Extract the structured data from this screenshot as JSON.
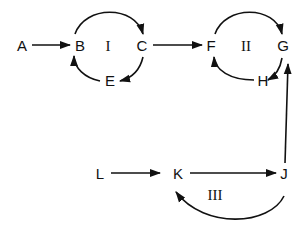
{
  "diagram": {
    "type": "directed-graph",
    "nodes": [
      {
        "id": "A",
        "label": "A",
        "x": 22,
        "y": 51
      },
      {
        "id": "B",
        "label": "B",
        "x": 80,
        "y": 51
      },
      {
        "id": "C",
        "label": "C",
        "x": 142,
        "y": 51
      },
      {
        "id": "E",
        "label": "E",
        "x": 110,
        "y": 86
      },
      {
        "id": "F",
        "label": "F",
        "x": 211,
        "y": 51
      },
      {
        "id": "G",
        "label": "G",
        "x": 283,
        "y": 51
      },
      {
        "id": "H",
        "label": "H",
        "x": 263,
        "y": 86
      },
      {
        "id": "L",
        "label": "L",
        "x": 100,
        "y": 179
      },
      {
        "id": "K",
        "label": "K",
        "x": 178,
        "y": 179
      },
      {
        "id": "J",
        "label": "J",
        "x": 284,
        "y": 179
      }
    ],
    "cycles": [
      {
        "id": "I",
        "label": "I",
        "members": [
          "B",
          "C",
          "E"
        ]
      },
      {
        "id": "II",
        "label": "II",
        "members": [
          "F",
          "G",
          "H"
        ]
      },
      {
        "id": "III",
        "label": "III",
        "members": [
          "K",
          "J"
        ]
      }
    ],
    "edges": [
      {
        "from": "A",
        "to": "B"
      },
      {
        "from": "B",
        "to": "C",
        "curved": true
      },
      {
        "from": "C",
        "to": "E",
        "curved": true
      },
      {
        "from": "E",
        "to": "B",
        "curved": true
      },
      {
        "from": "C",
        "to": "F"
      },
      {
        "from": "F",
        "to": "G",
        "curved": true
      },
      {
        "from": "G",
        "to": "H",
        "curved": true
      },
      {
        "from": "H",
        "to": "F",
        "curved": true
      },
      {
        "from": "L",
        "to": "K"
      },
      {
        "from": "K",
        "to": "J"
      },
      {
        "from": "J",
        "to": "G"
      },
      {
        "from": "J",
        "to": "K",
        "curved": true
      }
    ]
  }
}
